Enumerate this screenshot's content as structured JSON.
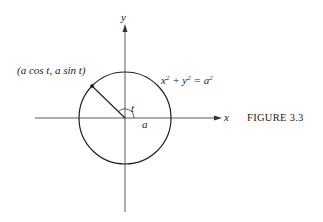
{
  "figure": {
    "caption": "FIGURE 3.3",
    "axes": {
      "x_label": "x",
      "y_label": "y"
    },
    "circle": {
      "equation_html": "x<sup>2</sup> + y<sup>2</sup> = a<sup>2</sup>",
      "radius_label": "a"
    },
    "point": {
      "label": "(a cos t, a sin t)"
    },
    "angle": {
      "label": "t"
    },
    "colors": {
      "stroke": "#222222",
      "background": "#ffffff"
    }
  }
}
